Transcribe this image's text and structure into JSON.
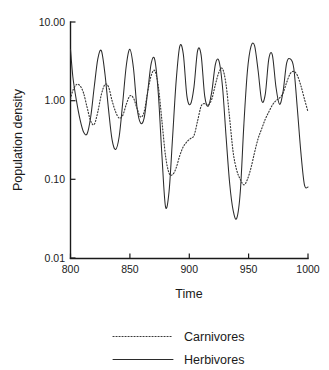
{
  "chart_data": {
    "type": "line",
    "title": "",
    "xlabel": "Time",
    "ylabel": "Population density",
    "xlim": [
      800,
      1000
    ],
    "ylim": [
      0.01,
      10.0
    ],
    "yscale": "log",
    "xticks": [
      800,
      850,
      900,
      950,
      1000
    ],
    "xticklabels": [
      "800",
      "850",
      "900",
      "950",
      "1000"
    ],
    "yticks": [
      0.01,
      0.1,
      1.0,
      10.0
    ],
    "yticklabels": [
      "0.01",
      "0.10",
      "1.00",
      "10.00"
    ],
    "grid": false,
    "legend_position": "below",
    "series": [
      {
        "name": "Carnivores",
        "style": "dotted",
        "color": "#3a3a3a",
        "x": [
          800,
          802,
          805,
          808,
          811,
          814,
          817,
          820,
          823,
          826,
          829,
          832,
          835,
          838,
          841,
          844,
          847,
          850,
          853,
          856,
          859,
          862,
          865,
          868,
          871,
          874,
          877,
          880,
          883,
          886,
          889,
          892,
          895,
          898,
          901,
          904,
          907,
          910,
          913,
          916,
          919,
          922,
          925,
          928,
          931,
          934,
          937,
          940,
          943,
          946,
          949,
          952,
          955,
          958,
          961,
          964,
          967,
          970,
          973,
          976,
          979,
          982,
          985,
          988,
          991,
          994,
          997,
          1000
        ],
        "y": [
          1.05,
          1.35,
          1.6,
          1.55,
          1.25,
          0.82,
          0.55,
          0.5,
          0.72,
          1.2,
          1.6,
          1.5,
          1.0,
          0.72,
          0.6,
          0.65,
          0.9,
          1.15,
          1.08,
          0.8,
          0.62,
          0.72,
          1.3,
          2.1,
          2.4,
          1.5,
          0.55,
          0.2,
          0.12,
          0.115,
          0.14,
          0.2,
          0.26,
          0.3,
          0.33,
          0.36,
          0.55,
          0.85,
          0.92,
          0.88,
          1.05,
          1.6,
          2.3,
          2.55,
          1.6,
          0.6,
          0.22,
          0.13,
          0.1,
          0.085,
          0.1,
          0.14,
          0.22,
          0.33,
          0.44,
          0.58,
          0.72,
          0.88,
          1.0,
          1.08,
          1.25,
          1.7,
          2.2,
          2.35,
          2.1,
          1.55,
          1.05,
          0.72
        ]
      },
      {
        "name": "Herbivores",
        "style": "solid",
        "color": "#2b2b2b",
        "x": [
          800,
          802,
          805,
          808,
          811,
          814,
          817,
          820,
          823,
          826,
          829,
          832,
          835,
          838,
          841,
          844,
          847,
          850,
          853,
          856,
          859,
          862,
          865,
          868,
          871,
          874,
          877,
          880,
          883,
          886,
          889,
          892,
          895,
          898,
          901,
          904,
          907,
          910,
          913,
          916,
          919,
          922,
          925,
          928,
          931,
          934,
          937,
          940,
          943,
          946,
          949,
          952,
          955,
          958,
          961,
          964,
          967,
          970,
          973,
          976,
          979,
          982,
          985,
          988,
          991,
          994,
          997,
          1000
        ],
        "y": [
          4.5,
          2.0,
          1.0,
          0.58,
          0.4,
          0.38,
          0.62,
          1.5,
          3.4,
          4.3,
          2.2,
          0.78,
          0.32,
          0.24,
          0.35,
          0.95,
          2.8,
          4.5,
          2.6,
          0.82,
          0.52,
          0.6,
          1.3,
          3.0,
          3.3,
          1.2,
          0.2,
          0.045,
          0.07,
          0.35,
          1.8,
          4.9,
          3.9,
          1.15,
          0.9,
          1.5,
          4.3,
          3.8,
          1.15,
          0.85,
          1.3,
          2.9,
          3.2,
          1.5,
          0.35,
          0.09,
          0.04,
          0.032,
          0.07,
          0.5,
          2.4,
          4.9,
          5.0,
          2.4,
          1.0,
          1.2,
          3.4,
          3.8,
          1.5,
          0.9,
          1.3,
          3.0,
          3.4,
          2.6,
          0.8,
          0.22,
          0.085,
          0.08
        ]
      }
    ]
  },
  "axes": {
    "y_title": "Population density",
    "x_title": "Time"
  },
  "legend": {
    "items": [
      {
        "label": "Carnivores",
        "style": "dotted"
      },
      {
        "label": "Herbivores",
        "style": "solid"
      }
    ]
  }
}
